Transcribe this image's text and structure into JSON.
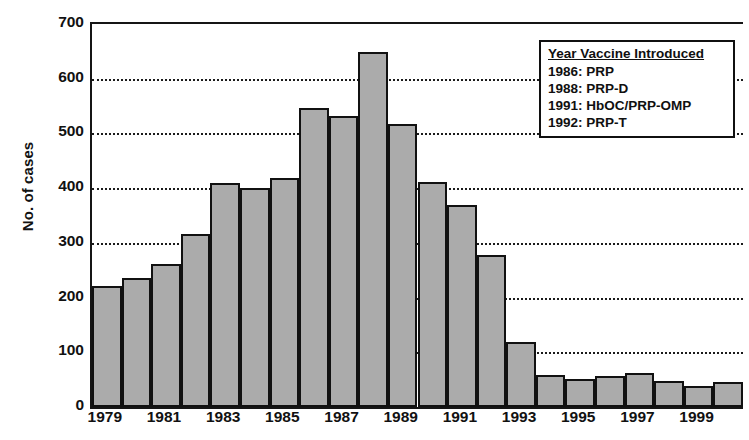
{
  "chart_data": {
    "type": "bar",
    "title": "",
    "xlabel": "",
    "ylabel": "No. of cases",
    "ylim": [
      0,
      700
    ],
    "ytick_values": [
      0,
      100,
      200,
      300,
      400,
      500,
      600,
      700
    ],
    "ytick_labels": [
      "0",
      "100",
      "200",
      "300",
      "400",
      "500",
      "600",
      "700"
    ],
    "grid": "horizontal dotted at 100,200,300,400,500,600",
    "legend_position": "top-right inside plot",
    "xtick_labels": [
      "1979",
      "1981",
      "1983",
      "1985",
      "1987",
      "1989",
      "1991",
      "1993",
      "1995",
      "1997",
      "1999"
    ],
    "categories": [
      "1979",
      "1980",
      "1981",
      "1982",
      "1983",
      "1984",
      "1985",
      "1986",
      "1987",
      "1988",
      "1989",
      "1990",
      "1991",
      "1992",
      "1993",
      "1994",
      "1995",
      "1996",
      "1997",
      "1998",
      "1999",
      "2000"
    ],
    "values": [
      222,
      235,
      261,
      317,
      410,
      400,
      419,
      546,
      531,
      648,
      517,
      412,
      369,
      278,
      118,
      58,
      52,
      56,
      63,
      47,
      38,
      45
    ],
    "bar_fill_color": "#ababab",
    "bar_edge_color": "#111111"
  },
  "legend": {
    "title": "Year Vaccine Introduced",
    "entries": [
      "1986: PRP",
      "1988: PRP-D",
      "1991: HbOC/PRP-OMP",
      "1992: PRP-T"
    ]
  },
  "caption": {
    "text": ""
  }
}
